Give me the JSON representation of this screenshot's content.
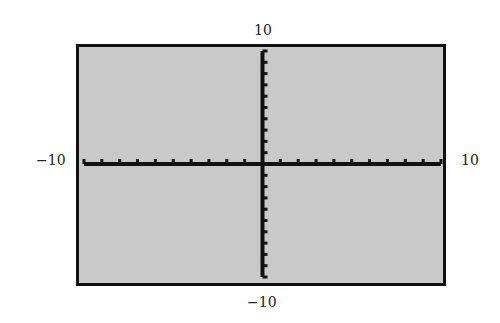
{
  "chart_data": {
    "type": "line",
    "xlim": [
      -10,
      10
    ],
    "ylim": [
      -10,
      10
    ],
    "xscl": 1,
    "yscl": 1,
    "tick_labels": {
      "top": "10",
      "bottom": "−10",
      "left": "−10",
      "right": "10"
    },
    "series": [],
    "grid": false
  },
  "colors": {
    "screen": "#c9c9c9",
    "axis": "#111111"
  }
}
